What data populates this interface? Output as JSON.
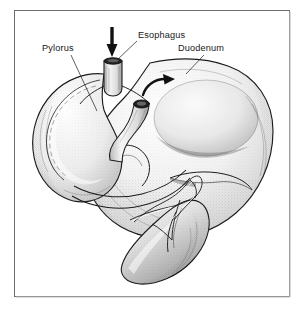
{
  "figure": {
    "kind": "anatomical-illustration",
    "style": "pen-and-ink stipple drawing",
    "border_color": "#6e6e70",
    "background_color": "#ffffff",
    "ink_color": "#202020"
  },
  "labels": [
    {
      "id": "pylorus",
      "text": "Pylorus",
      "x": 42,
      "y": 51,
      "anchor": "start",
      "leader": {
        "x1": 71,
        "y1": 55,
        "x2": 97,
        "y2": 111
      }
    },
    {
      "id": "esophagus",
      "text": "Esophagus",
      "x": 138,
      "y": 38,
      "anchor": "start",
      "leader": {
        "x1": 137,
        "y1": 41,
        "x2": 117,
        "y2": 60
      }
    },
    {
      "id": "duodenum",
      "text": "Duodenum",
      "x": 178,
      "y": 51,
      "anchor": "start",
      "leader": {
        "x1": 204,
        "y1": 55,
        "x2": 186,
        "y2": 74
      }
    }
  ],
  "annotations": {
    "inflow_arrow": {
      "name": "esophagus-inflow-arrow",
      "direction": "down",
      "color": "#111111",
      "x": 112,
      "y_top": 27,
      "y_tip": 57
    },
    "flow_arrow": {
      "name": "gastric-flow-arrow",
      "direction": "curved-right",
      "color": "#111111"
    }
  },
  "structures": [
    {
      "id": "stomach-body",
      "name": "Stomach body / greater curvature"
    },
    {
      "id": "fundus",
      "name": "Fundus"
    },
    {
      "id": "pyloric-loop",
      "name": "Pylorus and duodenal loop"
    },
    {
      "id": "esophagus-stump",
      "name": "Esophageal stump"
    },
    {
      "id": "cut-tube",
      "name": "Cut tubular structure"
    },
    {
      "id": "spleen",
      "name": "Spleen with vessels"
    }
  ]
}
